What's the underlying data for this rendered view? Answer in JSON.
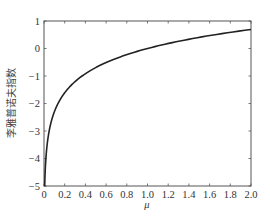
{
  "chart_data": {
    "type": "line",
    "title": "",
    "xlabel": "μ",
    "ylabel": "李雅普诺夫指数",
    "xlim": [
      0,
      2.0
    ],
    "ylim": [
      -5,
      1
    ],
    "x_ticks": [
      "0",
      "0.2",
      "0.4",
      "0.6",
      "0.8",
      "1.0",
      "1.2",
      "1.4",
      "1.6",
      "1.8",
      "2.0"
    ],
    "y_ticks": [
      "1",
      "0",
      "−1",
      "−2",
      "−3",
      "−4",
      "−5"
    ],
    "grid": false,
    "legend": null,
    "series": [
      {
        "name": "Lyapunov exponent",
        "color": "#222222",
        "x": [
          0.0067,
          0.01,
          0.02,
          0.03,
          0.05,
          0.07,
          0.1,
          0.13,
          0.15,
          0.2,
          0.25,
          0.3,
          0.39,
          0.5,
          0.6,
          0.77,
          0.9,
          1.0,
          1.2,
          1.43,
          1.6,
          1.8,
          2.0
        ],
        "y": [
          -5.0,
          -4.61,
          -3.91,
          -3.51,
          -3.0,
          -2.66,
          -2.3,
          -2.04,
          -1.9,
          -1.61,
          -1.39,
          -1.2,
          -0.94,
          -0.69,
          -0.51,
          -0.26,
          -0.11,
          0.0,
          0.18,
          0.36,
          0.47,
          0.59,
          0.67
        ]
      }
    ]
  },
  "plot": {
    "x_label": "μ",
    "y_label": "李雅普诺夫指数"
  }
}
